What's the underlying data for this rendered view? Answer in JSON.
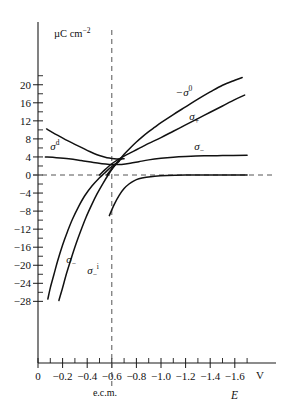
{
  "chart_data": {
    "type": "line",
    "title": "",
    "xlabel": "E",
    "xunit": "V",
    "ylabel": "",
    "yunit": "µC cm−2",
    "xlim": [
      0.0,
      -1.75
    ],
    "ylim": [
      -28,
      22
    ],
    "grid": false,
    "legend_position": "inline-labels",
    "x_ticks": [
      "0",
      "−0.2",
      "−0.4",
      "−0.6",
      "−0.8",
      "−1.0",
      "−1.2",
      "−1.4",
      "−1.6"
    ],
    "x_tick_values": [
      0.0,
      -0.2,
      -0.4,
      -0.6,
      -0.8,
      -1.0,
      -1.2,
      -1.4,
      -1.6
    ],
    "y_ticks": [
      "20",
      "16",
      "12",
      "8",
      "4",
      "0",
      "−4",
      "−8",
      "−12",
      "−16",
      "−20",
      "−24",
      "−28"
    ],
    "y_tick_values": [
      20,
      16,
      12,
      8,
      4,
      0,
      -4,
      -8,
      -12,
      -16,
      -20,
      -24,
      -28
    ],
    "annotations": [
      {
        "name": "ecm-marker",
        "text": "e.c.m.",
        "x": -0.6,
        "style": "vertical-dashed-line"
      },
      {
        "name": "zero-line",
        "text": "",
        "y": 0,
        "style": "horizontal-dashed-line"
      }
    ],
    "series": [
      {
        "name": "-sigma-0",
        "label": "−σ",
        "label_sup": "0",
        "label_sub": "",
        "label_x": -1.12,
        "label_y": 17.6,
        "points": [
          [
            -0.56,
            0.0
          ],
          [
            -0.6,
            1.4
          ],
          [
            -0.65,
            3.0
          ],
          [
            -0.7,
            4.6
          ],
          [
            -0.75,
            6.0
          ],
          [
            -0.8,
            7.3
          ],
          [
            -0.85,
            8.5
          ],
          [
            -0.9,
            9.6
          ],
          [
            -0.95,
            10.6
          ],
          [
            -1.0,
            11.6
          ],
          [
            -1.1,
            13.4
          ],
          [
            -1.2,
            15.1
          ],
          [
            -1.3,
            16.8
          ],
          [
            -1.4,
            18.4
          ],
          [
            -1.5,
            19.9
          ],
          [
            -1.6,
            21.0
          ],
          [
            -1.66,
            21.6
          ]
        ]
      },
      {
        "name": "sigma-plus",
        "label": "σ",
        "label_sup": "",
        "label_sub": "+",
        "label_x": -1.23,
        "label_y": 12.2,
        "points": [
          [
            -0.5,
            0.0
          ],
          [
            -0.55,
            1.3
          ],
          [
            -0.6,
            2.5
          ],
          [
            -0.65,
            3.4
          ],
          [
            -0.7,
            4.2
          ],
          [
            -0.75,
            4.9
          ],
          [
            -0.8,
            5.6
          ],
          [
            -0.85,
            6.3
          ],
          [
            -0.9,
            7.0
          ],
          [
            -1.0,
            8.3
          ],
          [
            -1.1,
            9.7
          ],
          [
            -1.2,
            11.1
          ],
          [
            -1.3,
            12.5
          ],
          [
            -1.4,
            13.9
          ],
          [
            -1.5,
            15.3
          ],
          [
            -1.6,
            16.7
          ],
          [
            -1.68,
            17.7
          ]
        ]
      },
      {
        "name": "sigma-minus-upper",
        "label": "σ",
        "label_sup": "",
        "label_sub": "−",
        "label_x": -1.27,
        "label_y": 5.6,
        "points": [
          [
            -0.06,
            4.0
          ],
          [
            -0.15,
            3.85
          ],
          [
            -0.25,
            3.6
          ],
          [
            -0.35,
            3.2
          ],
          [
            -0.45,
            2.75
          ],
          [
            -0.52,
            2.5
          ],
          [
            -0.58,
            2.35
          ],
          [
            -0.62,
            2.3
          ],
          [
            -0.68,
            2.35
          ],
          [
            -0.75,
            2.6
          ],
          [
            -0.82,
            2.95
          ],
          [
            -0.9,
            3.35
          ],
          [
            -1.0,
            3.7
          ],
          [
            -1.1,
            3.95
          ],
          [
            -1.2,
            4.1
          ],
          [
            -1.35,
            4.25
          ],
          [
            -1.5,
            4.3
          ],
          [
            -1.7,
            4.35
          ]
        ]
      },
      {
        "name": "sigma-d",
        "label": "σ",
        "label_sup": "d",
        "label_sub": "",
        "label_x": -0.1,
        "label_y": 5.6,
        "points": [
          [
            -0.07,
            10.2
          ],
          [
            -0.12,
            9.4
          ],
          [
            -0.18,
            8.5
          ],
          [
            -0.24,
            7.6
          ],
          [
            -0.3,
            6.8
          ],
          [
            -0.36,
            6.0
          ],
          [
            -0.42,
            5.2
          ],
          [
            -0.48,
            4.5
          ],
          [
            -0.54,
            4.0
          ],
          [
            -0.58,
            3.75
          ],
          [
            -0.62,
            3.6
          ],
          [
            -0.66,
            3.55
          ],
          [
            -0.7,
            3.6
          ]
        ]
      },
      {
        "name": "sigma-zero-plateau",
        "label": "",
        "label_sup": "",
        "label_sub": "",
        "label_x": 0,
        "label_y": 0,
        "points": [
          [
            -0.58,
            -9.0
          ],
          [
            -0.62,
            -6.5
          ],
          [
            -0.66,
            -4.5
          ],
          [
            -0.7,
            -3.0
          ],
          [
            -0.74,
            -2.0
          ],
          [
            -0.78,
            -1.3
          ],
          [
            -0.82,
            -0.85
          ],
          [
            -0.88,
            -0.5
          ],
          [
            -0.95,
            -0.25
          ],
          [
            -1.05,
            -0.1
          ],
          [
            -1.2,
            -0.02
          ],
          [
            -1.4,
            0.0
          ],
          [
            -1.7,
            0.0
          ]
        ]
      },
      {
        "name": "sigma-minus-lower",
        "label": "σ",
        "label_sup": "",
        "label_sub": "−",
        "label_x": -0.23,
        "label_y": -19.4,
        "points": [
          [
            -0.08,
            -27.5
          ],
          [
            -0.1,
            -25.0
          ],
          [
            -0.13,
            -22.0
          ],
          [
            -0.16,
            -19.0
          ],
          [
            -0.2,
            -15.5
          ],
          [
            -0.24,
            -12.5
          ],
          [
            -0.28,
            -9.8
          ],
          [
            -0.33,
            -7.0
          ],
          [
            -0.38,
            -4.6
          ],
          [
            -0.44,
            -2.4
          ],
          [
            -0.5,
            -0.6
          ],
          [
            -0.54,
            0.4
          ],
          [
            -0.58,
            1.4
          ],
          [
            -0.62,
            2.3
          ],
          [
            -0.66,
            3.0
          ]
        ]
      },
      {
        "name": "sigma-minus-i",
        "label": "σ",
        "label_sup": "i",
        "label_sub": "−",
        "label_x": -0.4,
        "label_y": -22.0,
        "points": [
          [
            -0.17,
            -27.8
          ],
          [
            -0.2,
            -25.0
          ],
          [
            -0.23,
            -22.0
          ],
          [
            -0.27,
            -18.5
          ],
          [
            -0.31,
            -15.2
          ],
          [
            -0.35,
            -12.2
          ],
          [
            -0.39,
            -9.4
          ],
          [
            -0.44,
            -6.4
          ],
          [
            -0.48,
            -4.2
          ],
          [
            -0.53,
            -1.8
          ],
          [
            -0.57,
            0.0
          ],
          [
            -0.61,
            1.6
          ],
          [
            -0.65,
            2.9
          ],
          [
            -0.68,
            3.6
          ]
        ]
      }
    ]
  },
  "axes": {
    "y_unit_label": "µC cm",
    "y_unit_sup": "−2",
    "x_axis_name": "E",
    "x_axis_unit": "V",
    "ecm_text": "e.c.m."
  }
}
